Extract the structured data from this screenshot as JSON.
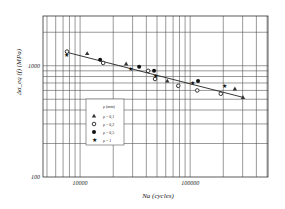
{
  "chart_data": {
    "type": "scatter",
    "title": "",
    "xlabel": "Na (cycles)",
    "ylabel": "Δσ_eq (f)   (MPa)",
    "x_scale": "log",
    "y_scale": "log",
    "xlim": [
      4600,
      510000
    ],
    "ylim": [
      100,
      2800
    ],
    "x_ticks": [
      {
        "value": 10000,
        "label": "10000"
      },
      {
        "value": 100000,
        "label": "100000"
      }
    ],
    "y_ticks": [
      {
        "value": 100,
        "label": "100"
      },
      {
        "value": 1000,
        "label": "1000"
      }
    ],
    "grid": true,
    "legend": {
      "title": "ρ (mm)",
      "position": "lower-left inside",
      "entries": [
        {
          "label": "ρ = 0,1",
          "marker": "triangle"
        },
        {
          "label": "ρ = 0,2",
          "marker": "open-circle"
        },
        {
          "label": "ρ = 0,5",
          "marker": "filled-circle"
        },
        {
          "label": "ρ = 1",
          "marker": "star"
        }
      ]
    },
    "series": [
      {
        "name": "ρ = 0,1",
        "marker": "triangle",
        "points": [
          [
            11600,
            1290
          ],
          [
            26200,
            1040
          ],
          [
            62000,
            730
          ],
          [
            255000,
            620
          ],
          [
            302000,
            520
          ]
        ]
      },
      {
        "name": "ρ = 0,2",
        "marker": "open-circle",
        "points": [
          [
            7600,
            1340
          ],
          [
            16200,
            1060
          ],
          [
            41500,
            900
          ],
          [
            48000,
            760
          ],
          [
            78000,
            660
          ],
          [
            116000,
            600
          ],
          [
            190000,
            560
          ]
        ]
      },
      {
        "name": "ρ = 0,5",
        "marker": "filled-circle",
        "points": [
          [
            15200,
            1130
          ],
          [
            34400,
            980
          ],
          [
            47000,
            900
          ],
          [
            118000,
            730
          ]
        ]
      },
      {
        "name": "ρ = 1",
        "marker": "star",
        "points": [
          [
            7500,
            1260
          ],
          [
            29000,
            940
          ],
          [
            48000,
            810
          ],
          [
            106000,
            700
          ],
          [
            204000,
            660
          ]
        ]
      }
    ],
    "fit_line": {
      "from": [
        7600,
        1320
      ],
      "to": [
        302000,
        520
      ]
    }
  }
}
